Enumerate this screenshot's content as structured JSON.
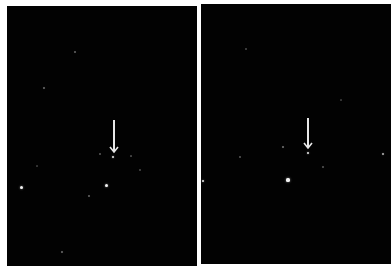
{
  "figure": {
    "panels": [
      {
        "id": "left",
        "arrow": {
          "x": 107,
          "y_top": 114,
          "y_tip": 147,
          "color": "#e8e8e8"
        },
        "stars": [
          {
            "x": 106,
            "y": 151,
            "r": 1.3,
            "b": 0.9
          },
          {
            "x": 14,
            "y": 181,
            "r": 1.5,
            "b": 0.95
          },
          {
            "x": 99,
            "y": 179,
            "r": 1.5,
            "b": 0.95
          },
          {
            "x": 68,
            "y": 46,
            "r": 0.8,
            "b": 0.35
          },
          {
            "x": 37,
            "y": 82,
            "r": 0.9,
            "b": 0.4
          },
          {
            "x": 55,
            "y": 246,
            "r": 0.9,
            "b": 0.4
          },
          {
            "x": 82,
            "y": 190,
            "r": 0.7,
            "b": 0.35
          },
          {
            "x": 133,
            "y": 164,
            "r": 0.7,
            "b": 0.25
          },
          {
            "x": 93,
            "y": 148,
            "r": 0.7,
            "b": 0.3
          },
          {
            "x": 124,
            "y": 150,
            "r": 0.6,
            "b": 0.25
          },
          {
            "x": 30,
            "y": 160,
            "r": 0.6,
            "b": 0.2
          }
        ]
      },
      {
        "id": "right",
        "arrow": {
          "x": 107,
          "y_top": 114,
          "y_tip": 145,
          "color": "#e8e8e8"
        },
        "stars": [
          {
            "x": 107,
            "y": 149,
            "r": 1.3,
            "b": 0.9
          },
          {
            "x": 2,
            "y": 177,
            "r": 1.4,
            "b": 0.9
          },
          {
            "x": 87,
            "y": 176,
            "r": 1.6,
            "b": 0.95
          },
          {
            "x": 182,
            "y": 150,
            "r": 1.1,
            "b": 0.7
          },
          {
            "x": 82,
            "y": 143,
            "r": 0.8,
            "b": 0.4
          },
          {
            "x": 39,
            "y": 153,
            "r": 0.7,
            "b": 0.3
          },
          {
            "x": 122,
            "y": 163,
            "r": 0.8,
            "b": 0.3
          },
          {
            "x": 45,
            "y": 45,
            "r": 0.7,
            "b": 0.25
          },
          {
            "x": 140,
            "y": 96,
            "r": 0.6,
            "b": 0.2
          }
        ]
      }
    ]
  }
}
